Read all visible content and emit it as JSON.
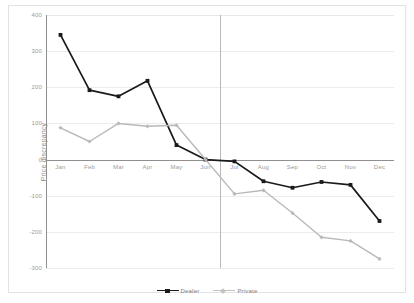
{
  "chart_data": {
    "type": "line",
    "title": "",
    "xlabel": "",
    "ylabel": "Price discrepancy",
    "categories": [
      "Jan",
      "Feb",
      "Mar",
      "Apr",
      "May",
      "Jun",
      "Jul",
      "Aug",
      "Sep",
      "Oct",
      "Nov",
      "Dec"
    ],
    "ylim": [
      -300,
      400
    ],
    "yticks": [
      400,
      300,
      200,
      100,
      0,
      -100,
      -200,
      -300
    ],
    "ytick_labels": [
      "400",
      "300",
      "200",
      "100",
      "0",
      "-100",
      "-200",
      "-300"
    ],
    "grid": true,
    "legend_position": "bottom",
    "series": [
      {
        "name": "Dealer",
        "color": "#1a1a1a",
        "marker": "square",
        "values": [
          345,
          192,
          175,
          218,
          40,
          0,
          -5,
          -60,
          -78,
          -62,
          -70,
          -170
        ]
      },
      {
        "name": "Private",
        "color": "#b9b9b9",
        "marker": "diamond",
        "values": [
          88,
          50,
          100,
          92,
          95,
          0,
          -95,
          -85,
          -148,
          -215,
          -225,
          -275
        ]
      }
    ]
  },
  "legend": {
    "entries": [
      {
        "label": "Dealer"
      },
      {
        "label": "Private"
      }
    ]
  },
  "colors": {
    "dealer": "#1a1a1a",
    "private": "#b9b9b9",
    "axis": "#8f8f8f",
    "grid": "#ececec",
    "tick_text": "#9a9a9a",
    "background": "#ffffff"
  }
}
